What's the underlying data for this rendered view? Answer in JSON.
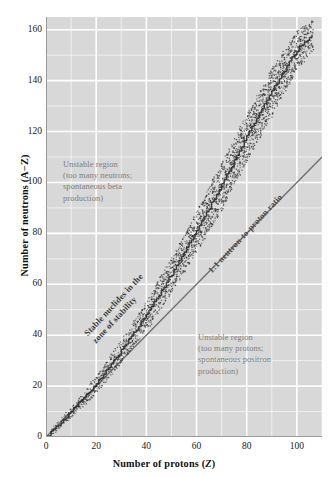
{
  "chart_data": {
    "type": "scatter",
    "title": "",
    "xlabel": "Number of protons (Z)",
    "ylabel": "Number of neutrons (A−Z)",
    "xlim": [
      0,
      110
    ],
    "ylim": [
      0,
      165
    ],
    "xticks": [
      0,
      20,
      40,
      60,
      80,
      100
    ],
    "yticks": [
      0,
      20,
      40,
      60,
      80,
      100,
      120,
      140,
      160
    ],
    "grid": true,
    "grid_minor_step": 10,
    "legend": "none",
    "reference_line": {
      "label": "1:1 neutron-to-proton ratio",
      "slope": 1,
      "intercept": 0,
      "from": [
        0,
        0
      ],
      "to": [
        110,
        110
      ]
    },
    "series": [
      {
        "name": "Stable nuclides in the zone of stability",
        "marker": "dot",
        "color": "#3a3a3a",
        "description": "Band of stable nuclides rising from origin, bending above the 1:1 line with increasing Z",
        "band_points": [
          {
            "z": 0,
            "n_center": 0,
            "half_width": 1
          },
          {
            "z": 10,
            "n_center": 10,
            "half_width": 2
          },
          {
            "z": 20,
            "n_center": 21,
            "half_width": 3
          },
          {
            "z": 30,
            "n_center": 34,
            "half_width": 4
          },
          {
            "z": 40,
            "n_center": 48,
            "half_width": 5
          },
          {
            "z": 50,
            "n_center": 64,
            "half_width": 6
          },
          {
            "z": 60,
            "n_center": 81,
            "half_width": 7
          },
          {
            "z": 70,
            "n_center": 99,
            "half_width": 8
          },
          {
            "z": 80,
            "n_center": 118,
            "half_width": 8
          },
          {
            "z": 90,
            "n_center": 136,
            "half_width": 8
          },
          {
            "z": 100,
            "n_center": 152,
            "half_width": 7
          },
          {
            "z": 106,
            "n_center": 158,
            "half_width": 5
          }
        ]
      }
    ],
    "annotations": [
      {
        "id": "unstable-neutrons",
        "text": "Unstable region\n(too many neutrons;\nspontaneous beta\nproduction)",
        "position": "upper-left",
        "color": "#7e7e7e"
      },
      {
        "id": "unstable-protons",
        "text": "Unstable region\n(too many protons;\nspontaneous positron\nproduction)",
        "position": "lower-right",
        "color": "#7e7e7e"
      },
      {
        "id": "stable-band-label",
        "text": "Stable nuclides in the\nzone of stability",
        "position": "along-band",
        "rotation": -47,
        "color": "#3a3a3a"
      },
      {
        "id": "ratio-line-label",
        "text": "1:1 neutron-to-proton ratio",
        "position": "along-diagonal",
        "rotation": -47,
        "color": "#4a4a4a"
      }
    ]
  },
  "axes": {
    "x_title_main": "Number of protons (",
    "x_title_var": "Z",
    "x_title_end": ")",
    "y_title": "Number of neutrons (A−Z)"
  },
  "colors": {
    "plot_background": "#d8d8d8",
    "gridline": "#ffffff",
    "axis_line": "#9a9a9a",
    "dot": "#3a3a3a",
    "annotation_gray": "#7e7e7e",
    "page_background": "#ffffff"
  }
}
